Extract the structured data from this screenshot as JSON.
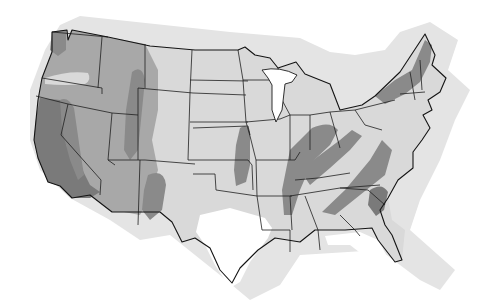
{
  "map": {
    "type": "choropleth-zones",
    "region": "contiguous-united-states",
    "legend": null,
    "title": null,
    "colors": {
      "background": "#ffffff",
      "offshore_shadow": "#e4e4e4",
      "zone_low": "#d9d9d9",
      "zone_white": "#ffffff",
      "zone_moderate": "#a8a8a8",
      "zone_high": "#8a8a8a",
      "zone_highest": "#7a7a7a",
      "state_borders": "#1f1f1f"
    },
    "zones": [
      {
        "name": "pacific-coast-band",
        "shade": "zone_highest",
        "area": "California coast and Sierra"
      },
      {
        "name": "great-basin",
        "shade": "zone_moderate",
        "area": "Nevada, Oregon, Washington, Idaho, Utah, Arizona"
      },
      {
        "name": "rocky-mountain-band",
        "shade": "zone_high",
        "area": "Idaho-Montana-Wyoming border"
      },
      {
        "name": "new-mexico-band",
        "shade": "zone_high",
        "area": "western New Mexico"
      },
      {
        "name": "central-plains-band",
        "shade": "zone_high",
        "area": "Nebraska-Kansas-Oklahoma"
      },
      {
        "name": "new-madrid-band",
        "shade": "zone_high",
        "area": "Illinois-Indiana-Kentucky-Tennessee"
      },
      {
        "name": "appalachian-band",
        "shade": "zone_high",
        "area": "Virginia to Alabama"
      },
      {
        "name": "carolina-band",
        "shade": "zone_highest",
        "area": "South Carolina"
      },
      {
        "name": "northeast-band",
        "shade": "zone_high",
        "area": "New York to Maine"
      },
      {
        "name": "texas-low-zone",
        "shade": "zone_white",
        "area": "central and south Texas"
      },
      {
        "name": "florida-low-zone",
        "shade": "zone_white",
        "area": "Florida peninsula"
      },
      {
        "name": "oregon-light-band",
        "shade": "zone_low",
        "area": "central Oregon"
      }
    ]
  }
}
